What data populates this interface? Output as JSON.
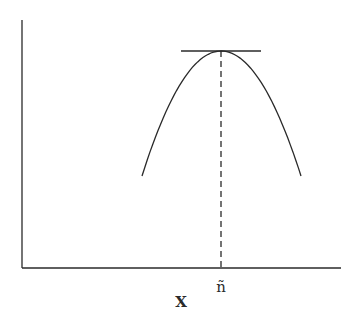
{
  "figure": {
    "type": "diagram",
    "x_axis_label": "X",
    "peak_marker_label": "ñ",
    "colors": {
      "ink": "#2a2a2a",
      "background": "#ffffff"
    }
  },
  "geometry": {
    "y_axis": {
      "x": 22,
      "y1": 20,
      "y2": 268
    },
    "x_axis": {
      "y": 268,
      "x1": 22,
      "x2": 341
    },
    "curve": {
      "start": [
        142,
        176
      ],
      "peak": [
        221,
        51
      ],
      "end": [
        301,
        176
      ]
    },
    "tangent": {
      "y": 51,
      "x1": 181,
      "x2": 261
    },
    "dashed_line": {
      "x": 221,
      "y1": 51,
      "y2": 268
    }
  }
}
